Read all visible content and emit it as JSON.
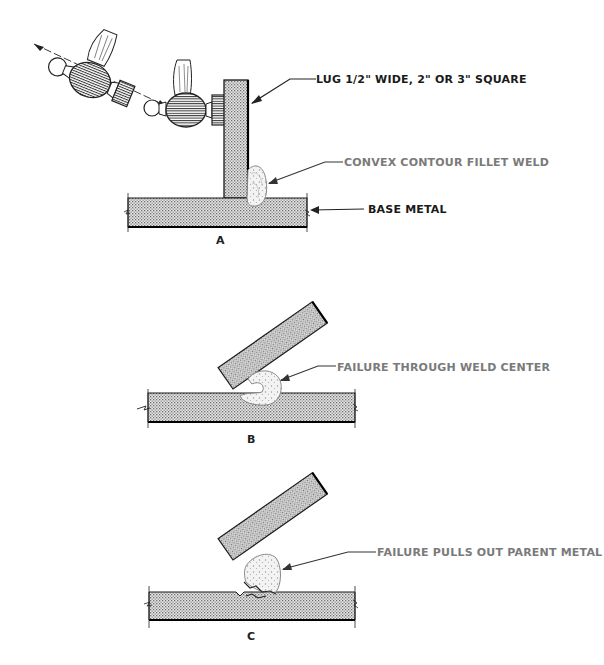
{
  "figure": {
    "panels": [
      {
        "id": "A",
        "label": "A",
        "callouts": [
          {
            "text": "LUG 1/2\" WIDE, 2\" OR 3\" SQUARE",
            "tone": "dark"
          },
          {
            "text": "CONVEX CONTOUR FILLET WELD",
            "tone": "grey"
          },
          {
            "text": "BASE METAL",
            "tone": "dark"
          }
        ]
      },
      {
        "id": "B",
        "label": "B",
        "callouts": [
          {
            "text": "FAILURE THROUGH WELD CENTER",
            "tone": "grey"
          }
        ]
      },
      {
        "id": "C",
        "label": "C",
        "callouts": [
          {
            "text": "FAILURE PULLS OUT PARENT METAL",
            "tone": "grey"
          }
        ]
      }
    ],
    "colors": {
      "line": "#1a1a1a",
      "hatch": "#8a8a8a",
      "grey_text": "#7a7a7a"
    }
  }
}
